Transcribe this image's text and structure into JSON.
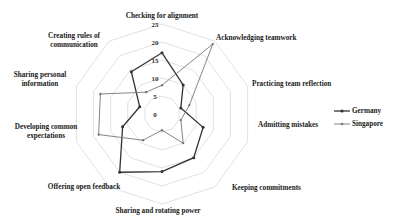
{
  "chart_data": {
    "type": "radar",
    "title": "",
    "categories": [
      "Checking for alignment",
      "Acknowledging teamwork",
      "Practicing team reflection",
      "Admitting mistakes",
      "Keeping commitments",
      "Sharing and rotating power",
      "Offering open feedback",
      "Developing common expectations",
      "Sharing personal information",
      "Creating rules of communication"
    ],
    "series": [
      {
        "name": "Germany",
        "color": "#333333",
        "values": [
          17,
          10,
          5.5,
          12,
          15,
          16,
          20,
          11.5,
          6.5,
          14.5
        ]
      },
      {
        "name": "Singapore",
        "color": "#777777",
        "values": [
          8,
          24,
          8,
          5.5,
          10,
          4.5,
          9,
          18.5,
          18,
          7.5
        ]
      }
    ],
    "rlim": [
      0,
      25
    ],
    "ticks": [
      0,
      5,
      10,
      15,
      20,
      25
    ],
    "grid": true,
    "legend_position": "right"
  },
  "axis_labels": [
    {
      "lines": [
        "Checking for alignment"
      ]
    },
    {
      "lines": [
        "Acknowledging teamwork"
      ]
    },
    {
      "lines": [
        "Practicing team reflection"
      ]
    },
    {
      "lines": [
        "Admitting mistakes"
      ]
    },
    {
      "lines": [
        "Keeping commitments"
      ]
    },
    {
      "lines": [
        "Sharing and rotating power"
      ]
    },
    {
      "lines": [
        "Offering open feedback"
      ]
    },
    {
      "lines": [
        "Developing common",
        "expectations"
      ]
    },
    {
      "lines": [
        "Sharing personal",
        "information"
      ]
    },
    {
      "lines": [
        "Creating rules of",
        "communication"
      ]
    }
  ],
  "legend": {
    "items": [
      {
        "label": "Germany"
      },
      {
        "label": "Singapore"
      }
    ]
  }
}
